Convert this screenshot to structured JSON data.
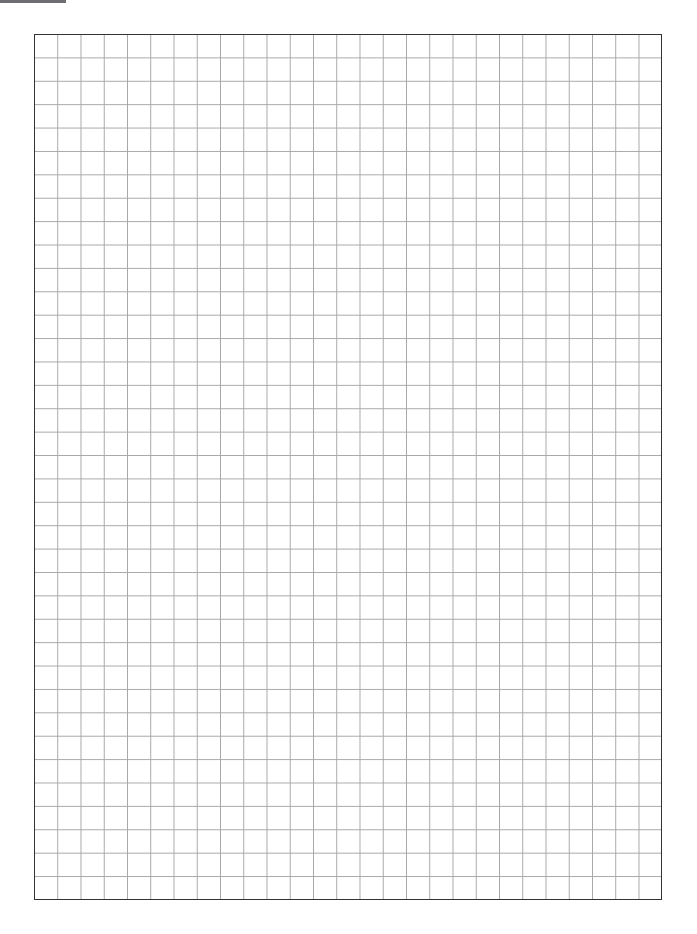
{
  "page": {
    "header_text": "",
    "header_tab_color": "#6d6e71"
  },
  "grid": {
    "columns": 27,
    "rows": 37,
    "line_color": "#a8a8a8",
    "border_color": "#333333"
  }
}
